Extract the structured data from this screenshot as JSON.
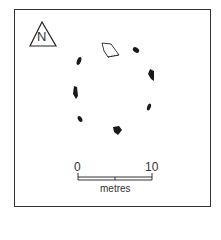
{
  "diagram": {
    "type": "stone-circle-plan",
    "north_label": "N",
    "scale": {
      "start_label": "0",
      "end_label": "10",
      "unit_label": "metres"
    },
    "stones": [
      {
        "id": "fallen-stone-outline",
        "x": 108,
        "y": 50,
        "style": "outline"
      },
      {
        "id": "stone-ne",
        "x": 137,
        "y": 51
      },
      {
        "id": "stone-e",
        "x": 151,
        "y": 75
      },
      {
        "id": "stone-se",
        "x": 149,
        "y": 106
      },
      {
        "id": "stone-s",
        "x": 117,
        "y": 131
      },
      {
        "id": "stone-sw",
        "x": 80,
        "y": 120
      },
      {
        "id": "stone-w",
        "x": 75,
        "y": 93
      },
      {
        "id": "stone-nw",
        "x": 79,
        "y": 61
      }
    ],
    "colors": {
      "ink": "#1a1a1a",
      "background": "#ffffff"
    }
  }
}
